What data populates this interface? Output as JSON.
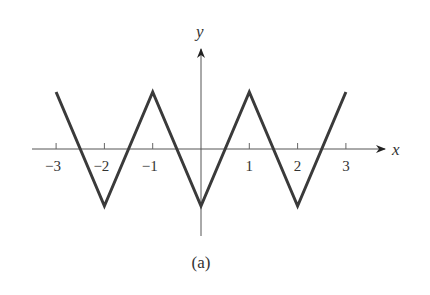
{
  "figure": {
    "caption": "(a)",
    "x_axis_label": "x",
    "y_axis_label": "y"
  },
  "chart_data": {
    "type": "line",
    "title": "",
    "caption": "(a)",
    "xlabel": "x",
    "ylabel": "y",
    "x_ticks": [
      "−3",
      "−2",
      "−1",
      "1",
      "2",
      "3"
    ],
    "x_tick_values": [
      -3,
      -2,
      -1,
      1,
      2,
      3
    ],
    "grid": false,
    "legend": null,
    "xlim": [
      -3.3,
      3.4
    ],
    "ylim": [
      -1.6,
      1.8
    ],
    "series": [
      {
        "name": "triangle wave",
        "color": "#3a3a3a",
        "x": [
          -3,
          -2,
          -1,
          0,
          1,
          2,
          3
        ],
        "y": [
          1,
          -1,
          1,
          -1,
          1,
          -1,
          1
        ]
      }
    ]
  },
  "colors": {
    "curve": "#3a3a3a",
    "axis": "#555555",
    "text": "#333333"
  }
}
